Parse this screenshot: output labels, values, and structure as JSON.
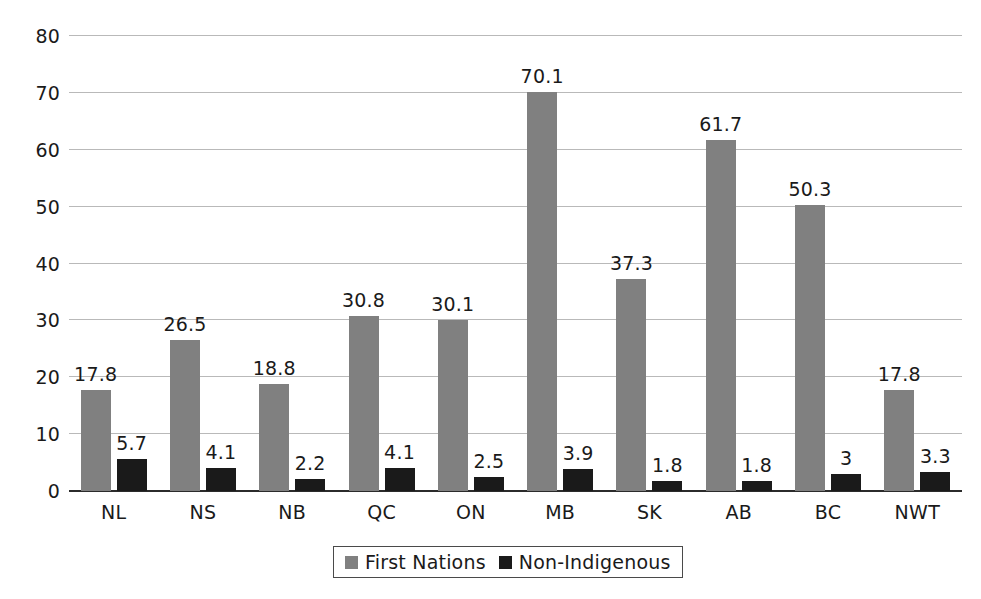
{
  "chart_data": {
    "type": "bar",
    "title": "",
    "subtitle": "",
    "xlabel": "",
    "ylabel": "",
    "categories": [
      "NL",
      "NS",
      "NB",
      "QC",
      "ON",
      "MB",
      "SK",
      "AB",
      "BC",
      "NWT"
    ],
    "series": [
      {
        "name": "First Nations",
        "color": "#808080",
        "values": [
          17.8,
          26.5,
          18.8,
          30.8,
          30.1,
          70.1,
          37.3,
          61.7,
          50.3,
          17.8
        ],
        "labels": [
          "17.8",
          "26.5",
          "18.8",
          "30.8",
          "30.1",
          "70.1",
          "37.3",
          "61.7",
          "50.3",
          "17.8"
        ]
      },
      {
        "name": "Non-Indigenous",
        "color": "#1a1a1a",
        "values": [
          5.7,
          4.1,
          2.2,
          4.1,
          2.5,
          3.9,
          1.8,
          1.8,
          3.0,
          3.3
        ],
        "labels": [
          "5.7",
          "4.1",
          "2.2",
          "4.1",
          "2.5",
          "3.9",
          "1.8",
          "1.8",
          "3",
          "3.3"
        ]
      }
    ],
    "ylim": [
      0,
      80
    ],
    "yticks": [
      0,
      10,
      20,
      30,
      40,
      50,
      60,
      70,
      80
    ],
    "ytick_labels": [
      "0",
      "10",
      "20",
      "30",
      "40",
      "50",
      "60",
      "70",
      "80"
    ],
    "grid": true,
    "data_labels": true,
    "legend_position": "bottom"
  },
  "legend": {
    "items": [
      {
        "label": "First Nations",
        "swatch": "first-nations"
      },
      {
        "label": "Non-Indigenous",
        "swatch": "non-indigenous"
      }
    ]
  }
}
